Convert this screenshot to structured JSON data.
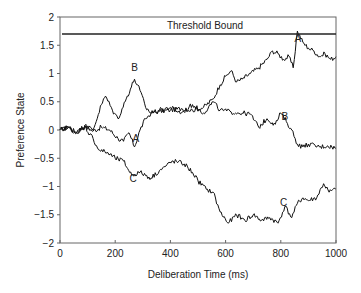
{
  "chart_data": {
    "type": "line",
    "title": "",
    "xlabel": "Deliberation Time (ms)",
    "ylabel": "Preference State",
    "xlim": [
      0,
      1000
    ],
    "ylim": [
      -2,
      2
    ],
    "xticks": [
      0,
      200,
      400,
      600,
      800,
      1000
    ],
    "yticks": [
      -2,
      -1.5,
      -1,
      -0.5,
      0,
      0.5,
      1,
      1.5,
      2
    ],
    "grid": false,
    "legend": "none",
    "threshold": {
      "label": "Threshold Bound",
      "value": 1.7
    },
    "series": [
      {
        "name": "A",
        "label_pos": [
          275,
          -0.22,
          862,
          1.55
        ],
        "x": [
          0,
          30,
          60,
          90,
          120,
          150,
          180,
          210,
          230,
          250,
          270,
          290,
          310,
          330,
          360,
          400,
          440,
          480,
          520,
          555,
          580,
          600,
          620,
          640,
          660,
          690,
          720,
          750,
          770,
          790,
          810,
          830,
          845,
          860,
          880,
          900,
          920,
          940,
          960,
          980,
          1000
        ],
        "y": [
          0,
          0.05,
          -0.05,
          0.08,
          -0.02,
          0.05,
          0.0,
          -0.15,
          -0.2,
          -0.05,
          -0.3,
          0.0,
          0.2,
          0.3,
          0.33,
          0.35,
          0.38,
          0.35,
          0.4,
          0.55,
          0.8,
          0.95,
          1.05,
          0.85,
          0.9,
          1.0,
          1.1,
          1.25,
          1.4,
          1.35,
          1.25,
          1.3,
          1.1,
          1.75,
          1.55,
          1.45,
          1.4,
          1.3,
          1.35,
          1.25,
          1.3
        ]
      },
      {
        "name": "B",
        "label_pos": [
          270,
          1.05,
          815,
          0.18
        ],
        "x": [
          0,
          30,
          60,
          90,
          120,
          150,
          165,
          190,
          210,
          240,
          270,
          290,
          310,
          330,
          360,
          400,
          440,
          480,
          520,
          555,
          580,
          620,
          660,
          690,
          720,
          750,
          780,
          800,
          820,
          840,
          860,
          880,
          900,
          940,
          970,
          1000
        ],
        "y": [
          0,
          0.05,
          -0.05,
          0.08,
          0.0,
          0.45,
          0.6,
          0.35,
          0.2,
          0.55,
          0.9,
          0.7,
          0.4,
          0.3,
          0.35,
          0.4,
          0.3,
          0.45,
          0.3,
          0.5,
          0.35,
          0.32,
          0.3,
          0.28,
          0.05,
          0.2,
          0.1,
          0.3,
          0.15,
          0.0,
          -0.25,
          -0.3,
          -0.25,
          -0.3,
          -0.28,
          -0.32
        ]
      },
      {
        "name": "C",
        "label_pos": [
          265,
          -0.92,
          810,
          -1.35
        ],
        "x": [
          0,
          30,
          60,
          90,
          120,
          140,
          170,
          200,
          230,
          260,
          290,
          330,
          360,
          380,
          410,
          450,
          480,
          500,
          530,
          555,
          580,
          610,
          640,
          670,
          700,
          730,
          760,
          790,
          815,
          840,
          860,
          880,
          900,
          930,
          955,
          975,
          1000
        ],
        "y": [
          0,
          0.05,
          -0.05,
          0.05,
          -0.15,
          -0.35,
          -0.4,
          -0.5,
          -0.55,
          -0.8,
          -0.75,
          -0.85,
          -0.72,
          -0.65,
          -0.55,
          -0.6,
          -0.75,
          -0.9,
          -1.05,
          -1.1,
          -1.45,
          -1.65,
          -1.5,
          -1.6,
          -1.5,
          -1.6,
          -1.55,
          -1.65,
          -1.35,
          -1.55,
          -1.3,
          -1.2,
          -1.25,
          -1.2,
          -0.95,
          -1.1,
          -1.05
        ]
      }
    ]
  }
}
